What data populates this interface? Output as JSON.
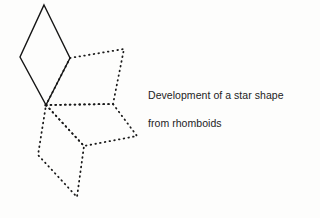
{
  "figure": {
    "title": "Development of a star shape from rhomboids",
    "background_color": "#fdfdfc",
    "ink_color": "#1a1a1a",
    "caption": {
      "line1": "Development of a star shape",
      "line2": "from rhomboids"
    },
    "shapes": [
      {
        "name": "solid-rhomboid",
        "style": "solid",
        "stroke_width": 1.4,
        "points": [
          [
            44,
            5
          ],
          [
            70,
            58
          ],
          [
            46,
            105
          ],
          [
            20,
            57
          ]
        ]
      },
      {
        "name": "dotted-rhomboid-upper-right",
        "style": "dotted",
        "stroke_width": 1.8,
        "points": [
          [
            70,
            58
          ],
          [
            124,
            49
          ],
          [
            113,
            104
          ],
          [
            46,
            105
          ]
        ]
      },
      {
        "name": "dotted-rhomboid-middle-right",
        "style": "dotted",
        "stroke_width": 1.8,
        "points": [
          [
            46,
            105
          ],
          [
            113,
            104
          ],
          [
            137,
            136
          ],
          [
            84,
            146
          ]
        ]
      },
      {
        "name": "dotted-rhomboid-lower-left",
        "style": "dotted",
        "stroke_width": 1.8,
        "points": [
          [
            46,
            105
          ],
          [
            84,
            146
          ],
          [
            77,
            197
          ],
          [
            38,
            155
          ]
        ]
      }
    ],
    "junction_points": [
      {
        "name": "shared-apex",
        "x": 46,
        "y": 105
      },
      {
        "name": "rhomboid-right-vertex",
        "x": 70,
        "y": 58
      },
      {
        "name": "star-point-upper-right",
        "x": 124,
        "y": 49
      },
      {
        "name": "star-inner-right",
        "x": 113,
        "y": 104
      },
      {
        "name": "star-point-right",
        "x": 137,
        "y": 136
      },
      {
        "name": "star-inner-lower",
        "x": 84,
        "y": 146
      },
      {
        "name": "star-point-bottom",
        "x": 77,
        "y": 197
      },
      {
        "name": "star-point-left",
        "x": 38,
        "y": 155
      },
      {
        "name": "star-point-top",
        "x": 44,
        "y": 5
      },
      {
        "name": "star-point-upper-left",
        "x": 20,
        "y": 57
      }
    ]
  }
}
